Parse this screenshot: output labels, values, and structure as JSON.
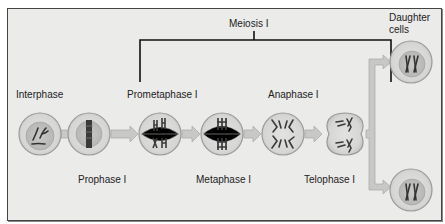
{
  "diagram": {
    "bracket_label": "Meiosis I",
    "daughter_label_line1": "Daughter",
    "daughter_label_line2": "cells",
    "stages": [
      {
        "name": "Interphase",
        "position": "top"
      },
      {
        "name": "Prophase I",
        "position": "bottom"
      },
      {
        "name": "Prometaphase I",
        "position": "top"
      },
      {
        "name": "Metaphase I",
        "position": "bottom"
      },
      {
        "name": "Anaphase I",
        "position": "top"
      },
      {
        "name": "Telophase I",
        "position": "bottom"
      }
    ],
    "colors": {
      "background": "#ebebea",
      "cell_fill": "#d9d9d7",
      "cell_border": "#9a9a98",
      "arrow": "#c6c6c4",
      "chromosome": "#3a3a3a",
      "bracket": "#111111"
    }
  }
}
